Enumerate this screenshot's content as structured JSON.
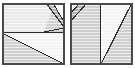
{
  "figure": {
    "canvas": {
      "width": 135,
      "height": 68
    },
    "palette": {
      "background": "#ffffff",
      "border": "#4a4a4a",
      "line": "#2b2b2b",
      "fill_lightest": "#f4f4f4",
      "fill_light": "#e9e9e9",
      "fill_mid": "#cfcfcf",
      "fill_dark": "#b5b5b5",
      "scanline": "#ffffff"
    },
    "squares": [
      {
        "name": "left-square",
        "label": "Square 1",
        "x": 2,
        "y": 3,
        "size": 62,
        "divider": {
          "type": "horizontal",
          "at": 30
        },
        "regions": [
          {
            "name": "top-left-field",
            "shade": "fill_light",
            "points": "2,3 46,3 52,10 44,32 2,32"
          },
          {
            "name": "top-band-upper",
            "shade": "fill_dark",
            "points": "46,3 53,3 64,23 64,28"
          },
          {
            "name": "top-band-lower",
            "shade": "fill_mid",
            "points": "44,32 52,10 64,28 64,32"
          },
          {
            "name": "bottom-lower-left",
            "shade": "fill_mid",
            "points": "2,33 64,64 2,64"
          },
          {
            "name": "bottom-upper-right",
            "shade": "fill_lightest",
            "points": "2,33 64,33 64,64"
          }
        ],
        "cuts": [
          {
            "name": "horizontal-divider",
            "from": "2,32.5",
            "to": "64,32.5"
          },
          {
            "name": "band-edge-outer",
            "from": "46,3",
            "to": "64,27"
          },
          {
            "name": "band-edge-inner",
            "from": "53,3",
            "to": "64,22"
          },
          {
            "name": "band-edge-lower",
            "from": "44,32",
            "to": "64,28"
          },
          {
            "name": "bottom-diagonal",
            "from": "2,33",
            "to": "64,64"
          }
        ]
      },
      {
        "name": "right-square",
        "label": "Square 2",
        "x": 70,
        "y": 3,
        "size": 62,
        "divider": {
          "type": "vertical",
          "at": 100
        },
        "regions": [
          {
            "name": "left-panel-upper",
            "shade": "fill_lightest",
            "points": "70,3 80,3 70,14"
          },
          {
            "name": "left-panel-band",
            "shade": "fill_dark",
            "points": "80,3 87,3 70,22 70,15"
          },
          {
            "name": "left-panel-field",
            "shade": "fill_mid",
            "points": "87,3 100,3 100,64 70,64 70,23"
          },
          {
            "name": "right-panel-upper",
            "shade": "fill_lightest",
            "points": "101,3 132,3 101,64"
          },
          {
            "name": "right-panel-lower",
            "shade": "fill_mid",
            "points": "132,3 132,64 101,64"
          }
        ],
        "cuts": [
          {
            "name": "vertical-divider",
            "from": "100.5,3",
            "to": "100.5,64"
          },
          {
            "name": "band-edge-outer",
            "from": "80,3",
            "to": "70,14"
          },
          {
            "name": "band-edge-inner",
            "from": "87,3",
            "to": "70,22"
          },
          {
            "name": "right-diagonal",
            "from": "101,64",
            "to": "132,3"
          }
        ]
      }
    ]
  }
}
